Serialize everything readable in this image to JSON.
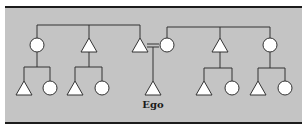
{
  "diagram": {
    "type": "kinship-chart",
    "colors": {
      "background": "#c4c4c4",
      "border": "#1c1c1c",
      "line": "#333333",
      "node_fill": "#ffffff"
    },
    "ego_label": "Ego",
    "legend": {
      "triangle": "male",
      "circle": "female",
      "equals": "marriage"
    },
    "left_family": {
      "parents_generation": [
        {
          "id": "L1",
          "shape": "circle",
          "x": 37
        },
        {
          "id": "L2",
          "shape": "triangle",
          "x": 89
        },
        {
          "id": "L3",
          "shape": "triangle",
          "x": 140
        }
      ],
      "children": {
        "L1": [
          {
            "shape": "triangle",
            "x": 24
          },
          {
            "shape": "circle",
            "x": 50
          }
        ],
        "L2": [
          {
            "shape": "triangle",
            "x": 75
          },
          {
            "shape": "circle",
            "x": 102
          }
        ]
      }
    },
    "right_family": {
      "parents_generation": [
        {
          "id": "R1",
          "shape": "circle",
          "x": 167
        },
        {
          "id": "R2",
          "shape": "triangle",
          "x": 220
        },
        {
          "id": "R3",
          "shape": "circle",
          "x": 270
        }
      ],
      "children": {
        "R2": [
          {
            "shape": "triangle",
            "x": 204
          },
          {
            "shape": "circle",
            "x": 232
          }
        ],
        "R3": [
          {
            "shape": "triangle",
            "x": 258
          },
          {
            "shape": "circle",
            "x": 285
          }
        ]
      }
    },
    "marriage": {
      "between": [
        "L3",
        "R1"
      ],
      "symbol": "="
    },
    "ego": {
      "shape": "triangle",
      "x": 153,
      "parents": [
        "L3",
        "R1"
      ]
    }
  }
}
